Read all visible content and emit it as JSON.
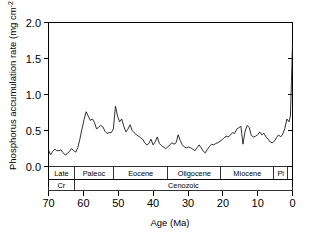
{
  "figure": {
    "name": "phosphorus-accumulation-rate-cenozoic",
    "background_color": "#ffffff",
    "line_color": "#1a1a1a"
  },
  "chart_data": {
    "type": "line",
    "title": "",
    "xlabel": "Age (Ma)",
    "ylabel": "Phosphorus accumulation rate (mg cm",
    "ylabel_superscript": "-2",
    "ylabel_tail": " per 1000y)",
    "xlim": [
      70,
      0
    ],
    "ylim": [
      0.0,
      2.0
    ],
    "x_reversed": true,
    "grid": false,
    "legend": null,
    "xticks": [
      70,
      60,
      50,
      40,
      30,
      20,
      10,
      0
    ],
    "xtick_labels": [
      "70",
      "60",
      "50",
      "40",
      "30",
      "20",
      "10",
      "0"
    ],
    "yticks": [
      0.0,
      0.5,
      1.0,
      1.5,
      2.0
    ],
    "ytick_labels": [
      "0.0",
      "0.5",
      "1.0",
      "1.5",
      "2.0"
    ],
    "series": [
      {
        "name": "Phosphorus accumulation rate",
        "x": [
          70.0,
          69.4,
          68.8,
          68.2,
          67.6,
          67.0,
          66.4,
          65.8,
          65.2,
          64.6,
          64.0,
          63.4,
          62.8,
          62.2,
          61.6,
          61.0,
          60.4,
          59.8,
          59.2,
          58.6,
          58.0,
          57.4,
          56.8,
          56.2,
          55.6,
          55.0,
          54.4,
          53.8,
          53.2,
          52.6,
          52.0,
          51.4,
          50.8,
          50.2,
          49.6,
          49.0,
          48.4,
          47.8,
          47.2,
          46.6,
          46.0,
          45.4,
          44.8,
          44.2,
          43.6,
          43.0,
          42.4,
          41.8,
          41.2,
          40.6,
          40.0,
          39.4,
          38.8,
          38.2,
          37.6,
          37.0,
          36.4,
          35.8,
          35.2,
          34.6,
          34.0,
          33.4,
          32.8,
          32.2,
          31.6,
          31.0,
          30.4,
          29.8,
          29.2,
          28.6,
          28.0,
          27.4,
          26.8,
          26.2,
          25.6,
          25.0,
          24.4,
          23.8,
          23.2,
          22.6,
          22.0,
          21.4,
          20.8,
          20.2,
          19.6,
          19.0,
          18.4,
          17.8,
          17.2,
          16.6,
          16.0,
          15.4,
          14.8,
          14.2,
          13.6,
          13.0,
          12.4,
          11.8,
          11.2,
          10.6,
          10.0,
          9.4,
          8.8,
          8.2,
          7.6,
          7.0,
          6.4,
          5.8,
          5.2,
          4.6,
          4.0,
          3.4,
          2.8,
          2.2,
          1.6,
          1.0,
          0.6,
          0.3,
          0.0
        ],
        "y": [
          0.23,
          0.16,
          0.21,
          0.24,
          0.22,
          0.22,
          0.23,
          0.19,
          0.16,
          0.18,
          0.21,
          0.25,
          0.22,
          0.2,
          0.26,
          0.38,
          0.52,
          0.65,
          0.76,
          0.7,
          0.64,
          0.66,
          0.61,
          0.52,
          0.55,
          0.57,
          0.55,
          0.49,
          0.46,
          0.47,
          0.47,
          0.52,
          0.84,
          0.7,
          0.62,
          0.66,
          0.56,
          0.48,
          0.52,
          0.58,
          0.5,
          0.47,
          0.44,
          0.42,
          0.4,
          0.38,
          0.33,
          0.3,
          0.32,
          0.38,
          0.3,
          0.34,
          0.41,
          0.32,
          0.29,
          0.27,
          0.25,
          0.27,
          0.3,
          0.33,
          0.31,
          0.33,
          0.44,
          0.36,
          0.3,
          0.27,
          0.26,
          0.27,
          0.26,
          0.24,
          0.22,
          0.26,
          0.3,
          0.26,
          0.21,
          0.19,
          0.24,
          0.28,
          0.31,
          0.3,
          0.32,
          0.33,
          0.35,
          0.37,
          0.4,
          0.42,
          0.41,
          0.44,
          0.47,
          0.46,
          0.52,
          0.54,
          0.56,
          0.31,
          0.49,
          0.57,
          0.54,
          0.43,
          0.41,
          0.42,
          0.44,
          0.48,
          0.44,
          0.46,
          0.41,
          0.38,
          0.34,
          0.33,
          0.35,
          0.4,
          0.44,
          0.41,
          0.45,
          0.53,
          0.66,
          0.62,
          0.7,
          1.18,
          1.7
        ]
      }
    ],
    "timescale": {
      "epochs": [
        {
          "label": "Late",
          "start_ma": 70.0,
          "end_ma": 62.6
        },
        {
          "label": "Paleoc",
          "start_ma": 62.6,
          "end_ma": 51.3
        },
        {
          "label": "Eocene",
          "start_ma": 51.3,
          "end_ma": 35.8
        },
        {
          "label": "Oligocene",
          "start_ma": 35.8,
          "end_ma": 20.6
        },
        {
          "label": "Miocene",
          "start_ma": 20.6,
          "end_ma": 5.4
        },
        {
          "label": "Pl",
          "start_ma": 5.4,
          "end_ma": 1.4
        },
        {
          "label": "",
          "start_ma": 1.4,
          "end_ma": 0.0
        }
      ],
      "eras": [
        {
          "label": "Cr",
          "start_ma": 70.0,
          "end_ma": 62.6
        },
        {
          "label": "Cenozoic",
          "start_ma": 62.6,
          "end_ma": 0.0
        }
      ]
    }
  }
}
